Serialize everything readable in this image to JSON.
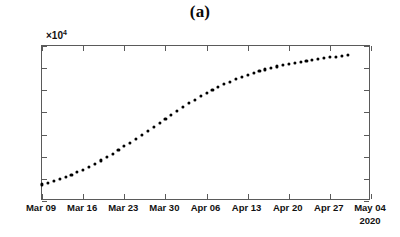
{
  "figure": {
    "title": "(a)",
    "year_label": "2020",
    "exponent_prefix": "×10",
    "exponent_power": "4"
  },
  "chart_data": {
    "type": "scatter",
    "title": "(a)",
    "xlabel": "",
    "ylabel": "",
    "y_multiplier": 10000,
    "y_multiplier_label": "×10^4",
    "ylim": [
      0,
      70000
    ],
    "yticks": [
      0,
      10000,
      20000,
      30000,
      40000,
      50000,
      60000,
      70000
    ],
    "ytick_labels": [
      "0",
      "1",
      "2",
      "3",
      "4",
      "5",
      "6",
      "7"
    ],
    "xlim": [
      "Mar 09",
      "May 04"
    ],
    "xtick_labels": [
      "Mar 09",
      "Mar 16",
      "Mar 23",
      "Mar 30",
      "Apr 06",
      "Apr 13",
      "Apr 20",
      "Apr 27",
      "May 04"
    ],
    "grid": false,
    "legend": null,
    "marker": "filled-circle",
    "marker_color": "#000000",
    "series": [
      {
        "name": "cumulative",
        "x": [
          "Mar 09",
          "Mar 10",
          "Mar 11",
          "Mar 12",
          "Mar 13",
          "Mar 14",
          "Mar 15",
          "Mar 16",
          "Mar 17",
          "Mar 18",
          "Mar 19",
          "Mar 20",
          "Mar 21",
          "Mar 22",
          "Mar 23",
          "Mar 24",
          "Mar 25",
          "Mar 26",
          "Mar 27",
          "Mar 28",
          "Mar 29",
          "Mar 30",
          "Mar 31",
          "Apr 01",
          "Apr 02",
          "Apr 03",
          "Apr 04",
          "Apr 05",
          "Apr 06",
          "Apr 07",
          "Apr 08",
          "Apr 09",
          "Apr 10",
          "Apr 11",
          "Apr 12",
          "Apr 13",
          "Apr 14",
          "Apr 15",
          "Apr 16",
          "Apr 17",
          "Apr 18",
          "Apr 19",
          "Apr 20",
          "Apr 21",
          "Apr 22",
          "Apr 23",
          "Apr 24",
          "Apr 25",
          "Apr 26",
          "Apr 27",
          "Apr 28",
          "Apr 29",
          "Apr 30"
        ],
        "values": [
          7500,
          8300,
          9100,
          10000,
          10900,
          11900,
          13000,
          14200,
          15500,
          16900,
          18300,
          19800,
          21400,
          23000,
          24700,
          26400,
          28200,
          30000,
          31800,
          33600,
          35400,
          37200,
          39000,
          40800,
          42500,
          44200,
          45800,
          47300,
          48800,
          50200,
          51500,
          52700,
          53900,
          55000,
          56000,
          56900,
          57800,
          58600,
          59400,
          60100,
          60800,
          61400,
          62000,
          62500,
          63000,
          63400,
          63800,
          64200,
          64600,
          64900,
          65200,
          65500,
          65800
        ]
      }
    ]
  }
}
